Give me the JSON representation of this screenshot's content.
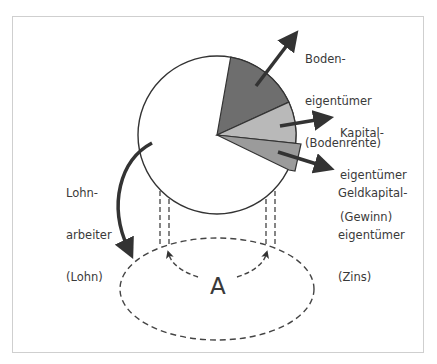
{
  "diagram": {
    "colors": {
      "outline": "#333333",
      "boden_slice": "#6e6e6e",
      "kapital_slice": "#b9b9b9",
      "zins_slice": "#9b9b9b",
      "arrow": "#333333",
      "text": "#3a3a3a",
      "frame": "#cfcfcf"
    },
    "pie": {
      "label_lohn": "Lohnarbeiter (Lohn)",
      "slices": [
        {
          "name": "Lohn",
          "fill": "white"
        },
        {
          "name": "Bodenrente",
          "fill": "dark gray"
        },
        {
          "name": "Gewinn",
          "fill": "light gray"
        },
        {
          "name": "Zins",
          "fill": "medium gray",
          "exploded": true
        }
      ]
    },
    "labels": {
      "boden": [
        "Boden-",
        "eigentümer",
        "(Bodenrente)"
      ],
      "kapital": [
        "Kapital-",
        "eigentümer",
        "(Gewinn)"
      ],
      "geldkapital": [
        "Geldkapital-",
        "eigentümer",
        "(Zins)"
      ],
      "lohn": [
        "Lohn-",
        "arbeiter",
        "(Lohn)"
      ],
      "center_a": "A"
    }
  }
}
